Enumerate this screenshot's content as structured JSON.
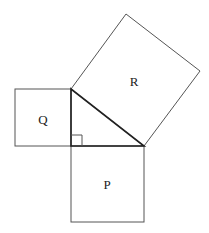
{
  "diagram": {
    "labels": {
      "r": "R",
      "q": "Q",
      "p": "P"
    },
    "colors": {
      "stroke": "#555555",
      "triangle": "#222222",
      "background": "#ffffff"
    }
  }
}
